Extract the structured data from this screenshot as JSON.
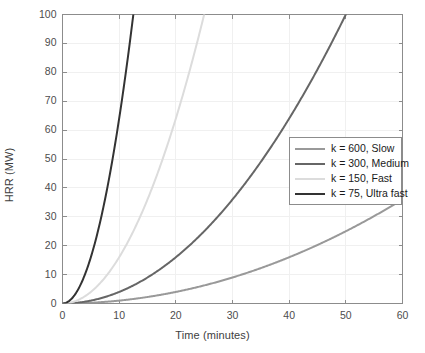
{
  "chart_data": {
    "type": "line",
    "title": "",
    "xlabel": "Time (minutes)",
    "ylabel": "HRR (MW)",
    "xlim": [
      0,
      60
    ],
    "ylim": [
      0,
      100
    ],
    "xticks": [
      0,
      10,
      20,
      30,
      40,
      50,
      60
    ],
    "yticks": [
      0,
      10,
      20,
      30,
      40,
      50,
      60,
      70,
      80,
      90,
      100
    ],
    "xtick_labels": [
      "0",
      "10",
      "20",
      "30",
      "40",
      "50",
      "60"
    ],
    "ytick_labels": [
      "0",
      "10",
      "20",
      "30",
      "40",
      "50",
      "60",
      "70",
      "80",
      "90",
      "100"
    ],
    "grid": true,
    "legend_position": "center-right",
    "series": [
      {
        "name": "k = 600, Slow",
        "k": 600,
        "color": "#999999",
        "linewidth": 2.0,
        "x": [
          0,
          5,
          10,
          15,
          20,
          25,
          30,
          35,
          40,
          45,
          50,
          55,
          60
        ],
        "y": [
          0,
          0.25,
          1.0,
          2.25,
          4.0,
          6.25,
          9.0,
          12.25,
          16.0,
          20.25,
          25.0,
          30.25,
          36.0
        ]
      },
      {
        "name": "k = 300, Medium",
        "k": 300,
        "color": "#666666",
        "linewidth": 2.0,
        "x": [
          0,
          5,
          10,
          15,
          20,
          25,
          30,
          35,
          40,
          45,
          50
        ],
        "y": [
          0,
          1.0,
          4.0,
          9.0,
          16.0,
          25.0,
          36.0,
          49.0,
          64.0,
          81.0,
          100.0
        ]
      },
      {
        "name": "k = 150, Fast",
        "k": 150,
        "color": "#dcdcdc",
        "linewidth": 2.0,
        "x": [
          0,
          2.5,
          5,
          7.5,
          10,
          12.5,
          15,
          17.5,
          20,
          22.5,
          25
        ],
        "y": [
          0,
          1.0,
          4.0,
          9.0,
          16.0,
          25.0,
          36.0,
          49.0,
          64.0,
          81.0,
          100.0
        ]
      },
      {
        "name": "k = 75, Ultra fast",
        "k": 75,
        "color": "#333333",
        "linewidth": 2.0,
        "x": [
          0,
          1.25,
          2.5,
          3.75,
          5,
          6.25,
          7.5,
          8.75,
          10,
          11.25,
          12.5
        ],
        "y": [
          0,
          1.0,
          4.0,
          9.0,
          16.0,
          25.0,
          36.0,
          49.0,
          64.0,
          81.0,
          100.0
        ]
      }
    ],
    "formula_note": "HRR(MW) = (t_seconds / k)^2"
  },
  "legend": {
    "items": [
      {
        "label": "k = 600, Slow",
        "color": "#999999"
      },
      {
        "label": "k = 300, Medium",
        "color": "#666666"
      },
      {
        "label": "k = 150, Fast",
        "color": "#dcdcdc"
      },
      {
        "label": "k = 75, Ultra fast",
        "color": "#333333"
      }
    ]
  },
  "style": {
    "axis_color": "#8c8c8c",
    "grid_color": "#f0f0f0",
    "tick_text_color": "#4d4d4d",
    "label_text_color": "#404040",
    "background": "#ffffff"
  }
}
